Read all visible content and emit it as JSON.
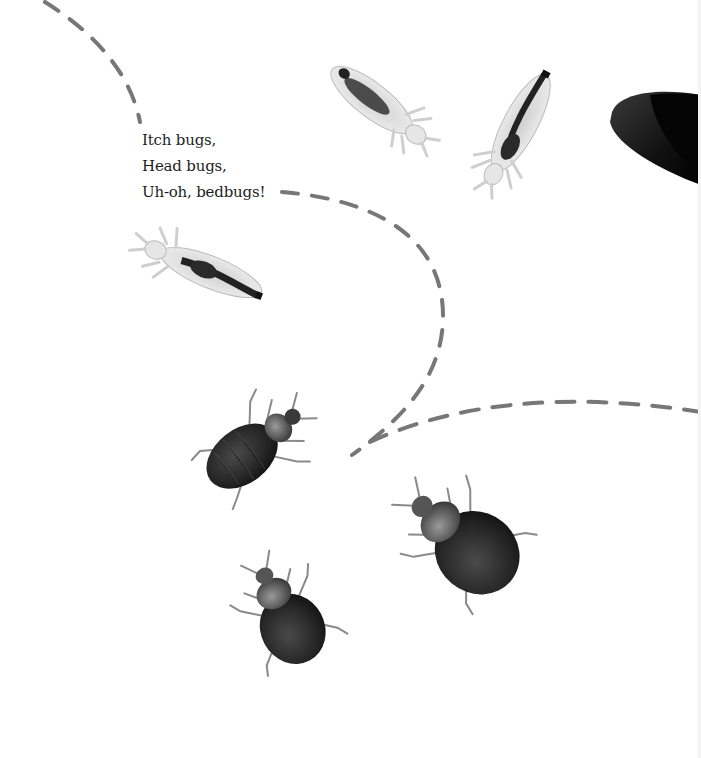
{
  "verse": {
    "lines": [
      "Itch bugs,",
      "Head bugs,",
      "Uh-oh, bedbugs!"
    ]
  },
  "illustrations": {
    "lice": [
      {
        "name": "head-louse-top-center"
      },
      {
        "name": "head-louse-top-right"
      },
      {
        "name": "head-louse-left"
      }
    ],
    "bedbugs": [
      {
        "name": "bedbug-upper-left"
      },
      {
        "name": "bedbug-right-large"
      },
      {
        "name": "bedbug-bottom"
      }
    ],
    "partial_object": "dark-shell-partial-right"
  },
  "colors": {
    "dash": "#777777",
    "text": "#1e1e1e",
    "bedbug": "#2a2a2a",
    "louse_body": "#d8d8d8",
    "louse_gut": "#2f2f2f"
  }
}
